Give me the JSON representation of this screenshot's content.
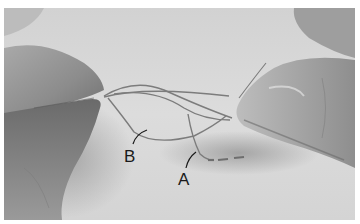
{
  "photo": {
    "description": "Grayscale photograph of two hands pulling sewing thread through fabric",
    "labels": [
      {
        "id": "B",
        "text": "B"
      },
      {
        "id": "A",
        "text": "A"
      }
    ],
    "colors": {
      "border": "#ffffff",
      "fabric": "#d6d6d6",
      "hand_shadow": "#6e6e6e",
      "thread": "#7a7a7a",
      "label_text": "#1a1a1a"
    }
  }
}
